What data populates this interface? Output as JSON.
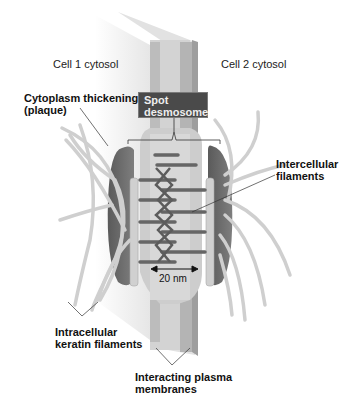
{
  "diagram": {
    "labels": {
      "cell1": "Cell 1 cytosol",
      "cell2": "Cell 2 cytosol",
      "plaque_line1": "Cytoplasm thickening",
      "plaque_line2": "(plaque)",
      "spot_line1": "Spot",
      "spot_line2": "desmosome",
      "intercellular_line1": "Intercellular",
      "intercellular_line2": "filaments",
      "keratin_line1": "Intracellular",
      "keratin_line2": "keratin filaments",
      "membranes_line1": "Interacting plasma",
      "membranes_line2": "membranes",
      "scale": "20 nm"
    },
    "colors": {
      "membrane_light": "#d6d6d6",
      "membrane_mid": "#b8b8b8",
      "plaque": "#6e6e6e",
      "filament": "#cfcfcf",
      "intercellular_filament": "#6a6a6a",
      "label_box": "#4a4a4a"
    }
  }
}
